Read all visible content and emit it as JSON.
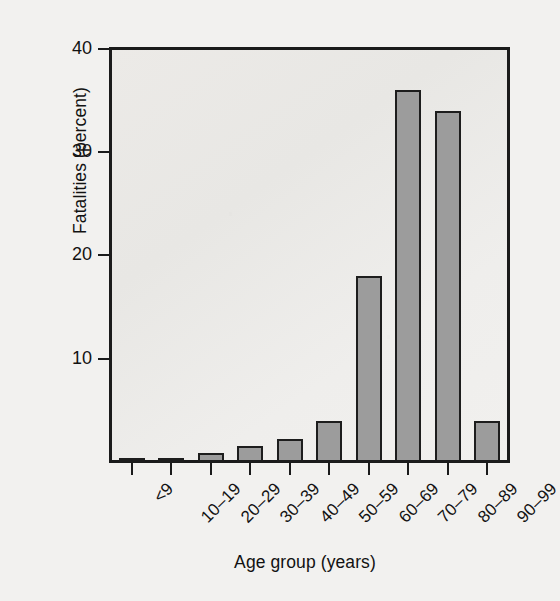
{
  "chart_data": {
    "type": "bar",
    "title": "",
    "xlabel": "Age group (years)",
    "ylabel": "Fatalities (percent)",
    "categories": [
      "<9",
      "10–19",
      "20–29",
      "30–39",
      "40–49",
      "50–59",
      "60–69",
      "70–79",
      "80–89",
      "90–99"
    ],
    "values": [
      0.3,
      0.3,
      0.9,
      1.5,
      2.2,
      4.0,
      18.0,
      36.0,
      34.0,
      4.0
    ],
    "ylim": [
      0,
      40
    ],
    "yticks": [
      0,
      10,
      20,
      30,
      40
    ],
    "ytick_labels": [
      "",
      "10",
      "20",
      "30",
      "40"
    ],
    "grid": false,
    "legend": null,
    "bar_color": "#9c9c9c",
    "bar_edge_color": "#1d1d1d",
    "axis_color": "#1b1b1b",
    "plot_background": "#ecebe8",
    "figure_background": "#f2f1ef"
  }
}
